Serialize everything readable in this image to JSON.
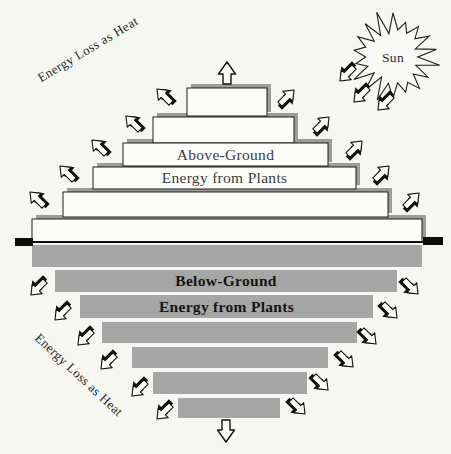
{
  "diagram": {
    "background": "#f6f6f3",
    "colors": {
      "bar_fill": "#fcfcf8",
      "bar_outline": "#1c1c1c",
      "bar_shadow": "#9c9c9c",
      "below_bar_fill": "#a6a6a6",
      "ground": "#0d0d0d"
    },
    "sun": {
      "label": "Sun",
      "cx": 393,
      "cy": 57,
      "r_outer": 42,
      "r_inner": 26
    },
    "ground_line": {
      "y": 242,
      "x1": 15,
      "x2": 443,
      "left_cap": {
        "x": 15,
        "y": 238,
        "w": 18,
        "h": 8
      },
      "right_cap": {
        "x": 423,
        "y": 237,
        "w": 20,
        "h": 8
      }
    },
    "above": {
      "label1": "Above-Ground",
      "label2": "Energy from Plants",
      "label1_level": 2,
      "label2_level": 3,
      "bars": [
        {
          "x": 187,
          "y": 88,
          "w": 80,
          "h": 28
        },
        {
          "x": 153,
          "y": 117,
          "w": 141,
          "h": 26
        },
        {
          "x": 123,
          "y": 143,
          "w": 205,
          "h": 23
        },
        {
          "x": 93,
          "y": 167,
          "w": 263,
          "h": 22
        },
        {
          "x": 63,
          "y": 192,
          "w": 325,
          "h": 25
        },
        {
          "x": 32,
          "y": 219,
          "w": 390,
          "h": 23
        }
      ],
      "apex_arrow": {
        "cx": 227,
        "cy": 73
      }
    },
    "below": {
      "label1": "Below-Ground",
      "label2": "Energy from Plants",
      "label1_level": 1,
      "label2_level": 2,
      "bars": [
        {
          "x": 32,
          "y": 245,
          "w": 390,
          "h": 22
        },
        {
          "x": 55,
          "y": 270,
          "w": 342,
          "h": 22
        },
        {
          "x": 80,
          "y": 295,
          "w": 293,
          "h": 23
        },
        {
          "x": 102,
          "y": 322,
          "w": 255,
          "h": 21
        },
        {
          "x": 132,
          "y": 347,
          "w": 196,
          "h": 21
        },
        {
          "x": 153,
          "y": 372,
          "w": 154,
          "h": 22
        },
        {
          "x": 178,
          "y": 398,
          "w": 102,
          "h": 20
        }
      ],
      "bottom_arrow": {
        "cx": 226,
        "cy": 431
      }
    },
    "heat_labels": [
      {
        "text": "Energy Loss as Heat",
        "x": 90,
        "y": 53,
        "angle": -31
      },
      {
        "text": "Energy Loss as Heat",
        "x": 76,
        "y": 378,
        "angle": 43
      }
    ],
    "heat_arrows": {
      "upper_left": {
        "angle": -135,
        "points": [
          [
            164,
            96
          ],
          [
            133,
            123
          ],
          [
            99,
            147
          ],
          [
            67,
            173
          ],
          [
            37,
            199
          ]
        ]
      },
      "upper_right": {
        "angle": -45,
        "points": [
          [
            287,
            97
          ],
          [
            322,
            124
          ],
          [
            355,
            148
          ],
          [
            382,
            173
          ],
          [
            412,
            200
          ]
        ]
      },
      "lower_left": {
        "angle": 135,
        "points": [
          [
            38,
            288
          ],
          [
            62,
            313
          ],
          [
            85,
            338
          ],
          [
            108,
            362
          ],
          [
            139,
            389
          ],
          [
            164,
            412
          ]
        ]
      },
      "lower_right": {
        "angle": 45,
        "points": [
          [
            411,
            287
          ],
          [
            390,
            311
          ],
          [
            369,
            337
          ],
          [
            346,
            360
          ],
          [
            321,
            383
          ],
          [
            298,
            407
          ]
        ]
      },
      "sun_to_plants": {
        "angle": 135,
        "points": [
          [
            347,
            74
          ],
          [
            361,
            95
          ],
          [
            385,
            103
          ]
        ]
      }
    }
  }
}
